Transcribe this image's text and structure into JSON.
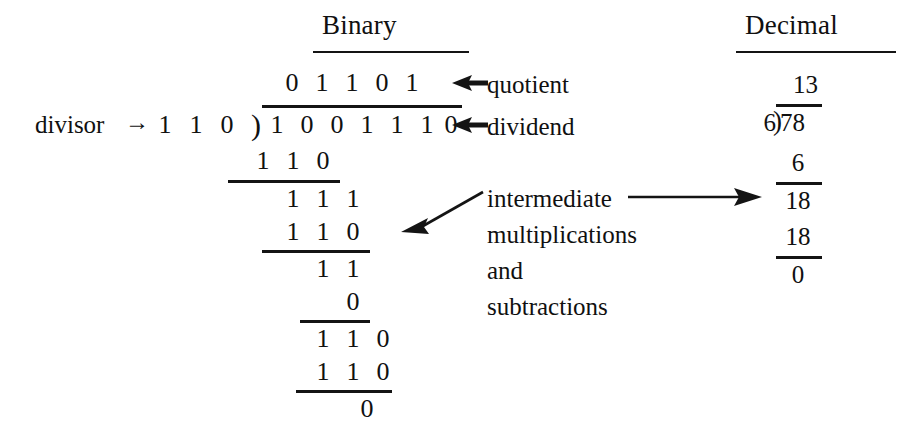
{
  "figure": {
    "background_color": "#ffffff",
    "ink_color": "#141414"
  },
  "headers": {
    "binary": "Binary",
    "decimal": "Decimal"
  },
  "labels": {
    "divisor": "divisor",
    "divisor_arrow_glyph": "→",
    "quotient": "quotient",
    "dividend": "dividend",
    "intermediate_line1": "intermediate",
    "intermediate_line2": "multiplications",
    "intermediate_line3": "and",
    "intermediate_line4": "subtractions"
  },
  "binary": {
    "divisor_digits": [
      "1",
      "1",
      "0"
    ],
    "bracket_glyph": ")",
    "quotient_digits": [
      "0",
      "1",
      "1",
      "0",
      "1"
    ],
    "dividend_digits": [
      "1",
      "0",
      "0",
      "1",
      "1",
      "1",
      "0"
    ],
    "steps": [
      {
        "name": "step-1-subtrahend",
        "digits": [
          "1",
          "1",
          "0"
        ],
        "start_col": 1,
        "underline": true
      },
      {
        "name": "step-1-remainder",
        "digits": [
          "1",
          "1",
          "1"
        ],
        "start_col": 2,
        "underline": false
      },
      {
        "name": "step-2-subtrahend",
        "digits": [
          "1",
          "1",
          "0"
        ],
        "start_col": 2,
        "underline": true
      },
      {
        "name": "step-2-remainder",
        "digits": [
          "1",
          "1"
        ],
        "start_col": 3,
        "underline": false
      },
      {
        "name": "step-3-subtrahend",
        "digits": [
          "0"
        ],
        "start_col": 4,
        "underline": true
      },
      {
        "name": "step-3-remainder",
        "digits": [
          "1",
          "1",
          "0"
        ],
        "start_col": 3,
        "underline": false
      },
      {
        "name": "step-4-subtrahend",
        "digits": [
          "1",
          "1",
          "0"
        ],
        "start_col": 3,
        "underline": true
      },
      {
        "name": "final-remainder",
        "digits": [
          "0"
        ],
        "start_col": 5,
        "underline": false
      }
    ]
  },
  "decimal": {
    "quotient": "13",
    "divisor": "6",
    "bracket_glyph": ")",
    "dividend": "78",
    "rows": [
      "6",
      "18",
      "18",
      "0"
    ]
  },
  "annotations": [
    {
      "name": "quotient-pointer",
      "style": "left-arrow-short"
    },
    {
      "name": "dividend-pointer",
      "style": "left-arrow-short"
    },
    {
      "name": "intermediate-pointer",
      "style": "diagonal-left-arrow"
    },
    {
      "name": "decimal-pointer",
      "style": "right-arrow-long"
    }
  ]
}
